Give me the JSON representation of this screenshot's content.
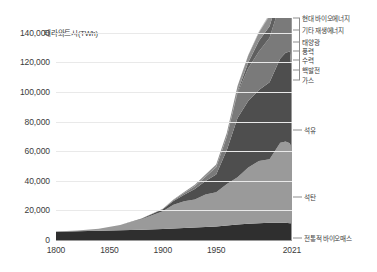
{
  "chart_data": {
    "type": "area",
    "stacked": true,
    "title": "",
    "subtitle": "",
    "xlabel": "",
    "ylabel": "테라와트시(TWh)",
    "ylim": [
      0,
      150000
    ],
    "xlim": [
      1800,
      2021
    ],
    "grid": true,
    "legend_position": "right-of-plot",
    "y_ticks": [
      "0",
      "20,000",
      "40,000",
      "60,000",
      "80,000",
      "100,000",
      "120,000",
      "140,000"
    ],
    "y_tick_values": [
      0,
      20000,
      40000,
      60000,
      80000,
      100000,
      120000,
      140000
    ],
    "x_ticks": [
      "1800",
      "1850",
      "1900",
      "1950",
      "2021"
    ],
    "x_tick_values": [
      1800,
      1850,
      1900,
      1950,
      2021
    ],
    "x": [
      1800,
      1820,
      1840,
      1860,
      1880,
      1900,
      1910,
      1920,
      1930,
      1940,
      1950,
      1960,
      1970,
      1980,
      1990,
      2000,
      2010,
      2015,
      2019,
      2020,
      2021
    ],
    "series": [
      {
        "name": "전통적 바이오매스",
        "color": "#2f2f2f",
        "values": [
          5600,
          5900,
          6200,
          6600,
          7000,
          7500,
          7800,
          8100,
          8400,
          8800,
          9200,
          9800,
          10400,
          11000,
          11400,
          11600,
          11700,
          11600,
          11400,
          11300,
          11300
        ]
      },
      {
        "name": "석탄",
        "color": "#9a9a9a",
        "values": [
          200,
          500,
          1400,
          3500,
          7000,
          12000,
          16000,
          18000,
          19000,
          22000,
          23000,
          28000,
          32000,
          38000,
          42000,
          43000,
          54000,
          55000,
          54000,
          52000,
          53000
        ]
      },
      {
        "name": "석유",
        "color": "#4e4e4e",
        "values": [
          0,
          0,
          0,
          100,
          400,
          1200,
          2600,
          4500,
          7000,
          9000,
          12000,
          23000,
          40000,
          45000,
          48000,
          52000,
          57000,
          60000,
          62000,
          56000,
          59000
        ]
      },
      {
        "name": "가스",
        "color": "#7a7a7a",
        "values": [
          0,
          0,
          0,
          0,
          100,
          300,
          600,
          1200,
          2000,
          3000,
          5000,
          9000,
          17000,
          22000,
          26000,
          30000,
          37000,
          40000,
          43000,
          42000,
          44000
        ]
      },
      {
        "name": "핵발전",
        "color": "#5f5f5f",
        "values": [
          0,
          0,
          0,
          0,
          0,
          0,
          0,
          0,
          0,
          0,
          0,
          100,
          1000,
          4000,
          7000,
          7900,
          7900,
          7700,
          7900,
          7600,
          7700
        ]
      },
      {
        "name": "수력",
        "color": "#8f8f8f",
        "values": [
          0,
          0,
          0,
          0,
          0,
          100,
          300,
          600,
          1000,
          1400,
          1800,
          2600,
          3600,
          4700,
          5700,
          6800,
          8600,
          9400,
          10200,
          10400,
          10400
        ]
      },
      {
        "name": "풍력",
        "color": "#6b6b6b",
        "values": [
          0,
          0,
          0,
          0,
          0,
          0,
          0,
          0,
          0,
          0,
          0,
          0,
          0,
          0,
          50,
          200,
          900,
          2100,
          3500,
          4000,
          4400
        ]
      },
      {
        "name": "태양광",
        "color": "#a5a5a5",
        "values": [
          0,
          0,
          0,
          0,
          0,
          0,
          0,
          0,
          0,
          0,
          0,
          0,
          0,
          0,
          0,
          10,
          100,
          700,
          1900,
          2300,
          2800
        ]
      },
      {
        "name": "기타 재생에너지",
        "color": "#808080",
        "values": [
          0,
          0,
          0,
          0,
          0,
          0,
          0,
          0,
          0,
          0,
          0,
          0,
          0,
          100,
          300,
          500,
          900,
          1300,
          1700,
          1800,
          1900
        ]
      },
      {
        "name": "현대 바이오에너지",
        "color": "#bdbdbd",
        "values": [
          0,
          0,
          0,
          0,
          0,
          0,
          0,
          0,
          0,
          0,
          0,
          0,
          0,
          200,
          500,
          900,
          2000,
          2800,
          3200,
          3200,
          3400
        ]
      }
    ],
    "annotations": [
      {
        "label": "현대 바이오에너지",
        "y_px": 18
      },
      {
        "label": "기타 재생에너지",
        "y_px": 30
      },
      {
        "label": "태양광",
        "y_px": 42
      },
      {
        "label": "풍력",
        "y_px": 51
      },
      {
        "label": "수력",
        "y_px": 60
      },
      {
        "label": "핵발전",
        "y_px": 70
      },
      {
        "label": "가스",
        "y_px": 80
      },
      {
        "label": "석유",
        "y_px": 130
      },
      {
        "label": "석탄",
        "y_px": 197
      },
      {
        "label": "전통적 바이오매스",
        "y_px": 238
      }
    ]
  }
}
